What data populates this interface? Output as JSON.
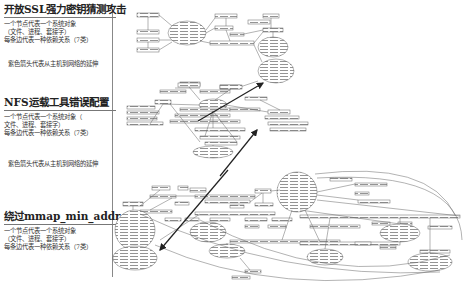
{
  "panels": [
    {
      "title": "开放SSL强力密钥猜测攻击",
      "desc": [
        "一个节点代表一个系统对象",
        "（文件、进程、套接字）",
        "每条边代表一种依赖关系（7类）"
      ],
      "note": "紫色箭头代表从主机到网络的延伸"
    },
    {
      "title": "NFS运载工具错误配置",
      "desc": [
        "一个节点代表一个系统对象（",
        "文件、进程、套接字）",
        "每条边代表一种依赖关系（7类）"
      ],
      "note": "紫色箭头代表从主机到网络的延伸"
    },
    {
      "title": "绕过mmap_min_addr",
      "desc": [
        "一个节点代表一个系统对象",
        "（文件、进程、套接字）",
        "每条边代表一种依赖关系（7类）"
      ],
      "note": ""
    }
  ],
  "graph": {
    "edge_color": "#555555",
    "arrow_color": "#222222",
    "node_stroke": "#666666"
  }
}
